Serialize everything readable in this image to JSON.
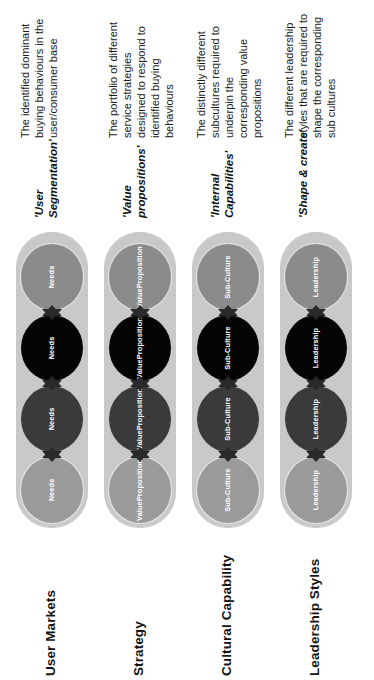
{
  "diagram": {
    "colors": {
      "capsule": "#c9c9c9",
      "node_light": "#9a9a9a",
      "node_dark": "#3a3a3a",
      "node_black": "#050505",
      "node_mid": "#8b8b8b",
      "arrow": "#2a2a2a",
      "text": "#131313",
      "background": "#ffffff"
    },
    "rows": [
      {
        "label": "User Markets",
        "heading": "'User Segmentation'",
        "description": "The identified dominant buying behaviours in the user/consumer base",
        "node_label": "Needs",
        "node_label_lines": [
          "Needs"
        ],
        "nodes": [
          {
            "shade": "shade-a",
            "label": "Needs"
          },
          {
            "shade": "shade-b",
            "label": "Needs"
          },
          {
            "shade": "shade-c",
            "label": "Needs"
          },
          {
            "shade": "shade-d",
            "label": "Needs"
          }
        ]
      },
      {
        "label": "Strategy",
        "heading": "'Value propositions'",
        "description": "The portfolio of different service strategies designed to respond to identified buying behaviours",
        "node_label": "Value Proposition",
        "node_label_lines": [
          "Value",
          "Proposition"
        ],
        "nodes": [
          {
            "shade": "shade-a",
            "label": "Value Proposition"
          },
          {
            "shade": "shade-b",
            "label": "Value Proposition"
          },
          {
            "shade": "shade-c",
            "label": "Value Proposition"
          },
          {
            "shade": "shade-d",
            "label": "Value Proposition"
          }
        ]
      },
      {
        "label": "Cultural Capability",
        "heading": "'Internal Capabilities'",
        "description": "The distinctly different subcultures required to underpin the corresponding value propositions",
        "node_label": "Sub-Culture",
        "node_label_lines": [
          "Sub-Culture"
        ],
        "nodes": [
          {
            "shade": "shade-a",
            "label": "Sub-Culture"
          },
          {
            "shade": "shade-b",
            "label": "Sub-Culture"
          },
          {
            "shade": "shade-c",
            "label": "Sub-Culture"
          },
          {
            "shade": "shade-d",
            "label": "Sub-Culture"
          }
        ]
      },
      {
        "label": "Leadership Styles",
        "heading": "'Shape & create'",
        "description": "The different leadership styles that are required to shape the corresponding sub cultures",
        "node_label": "Leadership",
        "node_label_lines": [
          "Leadership"
        ],
        "nodes": [
          {
            "shade": "shade-a",
            "label": "Leadership"
          },
          {
            "shade": "shade-b",
            "label": "Leadership"
          },
          {
            "shade": "shade-c",
            "label": "Leadership"
          },
          {
            "shade": "shade-d",
            "label": "Leadership"
          }
        ]
      }
    ],
    "arrow": {
      "name": "double-headed-arrow",
      "count_per_column": 3
    }
  }
}
